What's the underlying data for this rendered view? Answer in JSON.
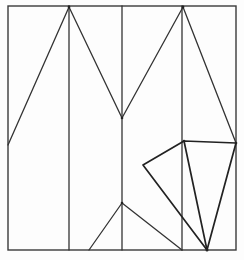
{
  "diagram": {
    "type": "geometric line drawing (folding pattern)",
    "stroke_color": "#333333",
    "background": "#fdfdfd",
    "frame": {
      "x": 8,
      "y": 6,
      "width": 228,
      "height": 244
    },
    "vertical_lines": [
      {
        "x": 69,
        "y1": 6,
        "y2": 250
      },
      {
        "x": 122,
        "y1": 6,
        "y2": 250
      },
      {
        "x": 182,
        "y1": 6,
        "y2": 250
      }
    ],
    "zigzag": [
      [
        8,
        145
      ],
      [
        69,
        7
      ],
      [
        122,
        118
      ],
      [
        183,
        7
      ],
      [
        236,
        143
      ]
    ],
    "kite": [
      [
        184,
        141
      ],
      [
        236,
        143
      ],
      [
        207,
        250
      ],
      [
        143,
        165
      ]
    ],
    "kite_diagonal": [
      [
        184,
        141
      ],
      [
        207,
        250
      ]
    ],
    "bottom_tent": [
      [
        89,
        250
      ],
      [
        122,
        203
      ],
      [
        182,
        250
      ]
    ],
    "vertices": [
      [
        69,
        7
      ],
      [
        183,
        7
      ],
      [
        122,
        118
      ],
      [
        8,
        145
      ],
      [
        236,
        143
      ],
      [
        184,
        141
      ],
      [
        143,
        165
      ],
      [
        207,
        250
      ],
      [
        122,
        203
      ]
    ]
  }
}
